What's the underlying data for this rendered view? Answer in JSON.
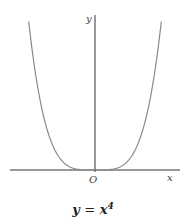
{
  "chart_data": {
    "type": "line",
    "caption": {
      "lhs": "y",
      "eq": "=",
      "base": "x",
      "exponent": "4"
    },
    "xlabel": "x",
    "ylabel": "y",
    "origin_label": "O",
    "function": "y = x^4",
    "xlim": [
      -1.3,
      1.4
    ],
    "ylim": [
      0,
      2.9
    ],
    "grid": false,
    "legend": null,
    "series": [
      {
        "name": "y = x^4",
        "color": "#8a8a8a",
        "x": [
          -1.3,
          -1.2,
          -1.1,
          -1.0,
          -0.9,
          -0.8,
          -0.7,
          -0.6,
          -0.5,
          -0.4,
          -0.3,
          -0.2,
          -0.1,
          0,
          0.1,
          0.2,
          0.3,
          0.4,
          0.5,
          0.6,
          0.7,
          0.8,
          0.9,
          1.0,
          1.1,
          1.2,
          1.3
        ],
        "values": [
          2.8561,
          2.0736,
          1.4641,
          1.0,
          0.6561,
          0.4096,
          0.2401,
          0.1296,
          0.0625,
          0.0256,
          0.0081,
          0.0016,
          0.0001,
          0,
          0.0001,
          0.0016,
          0.0081,
          0.0256,
          0.0625,
          0.1296,
          0.2401,
          0.4096,
          0.6561,
          1.0,
          1.4641,
          2.0736,
          2.8561
        ]
      }
    ],
    "axis_color": "#333333"
  }
}
